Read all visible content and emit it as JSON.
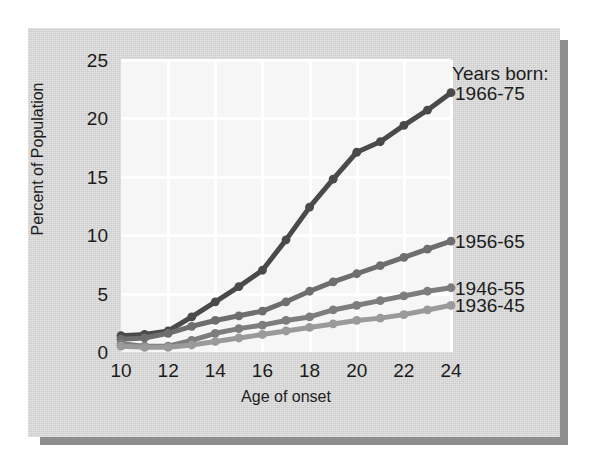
{
  "chart_data": {
    "type": "line",
    "title": "",
    "xlabel": "Age of onset",
    "ylabel": "Percent of Population",
    "legend_title": "Years born:",
    "legend_position": "right-inline",
    "grid": true,
    "xlim": [
      10,
      24
    ],
    "ylim": [
      0,
      25
    ],
    "xticks": [
      10,
      12,
      14,
      16,
      18,
      20,
      22,
      24
    ],
    "yticks": [
      0,
      5,
      10,
      15,
      20,
      25
    ],
    "x": [
      10,
      11,
      12,
      13,
      14,
      15,
      16,
      17,
      18,
      19,
      20,
      21,
      22,
      23,
      24
    ],
    "series": [
      {
        "name": "1966-75",
        "color": "#4a4a4a",
        "values": [
          1.4,
          1.5,
          1.8,
          3.0,
          4.3,
          5.6,
          7.0,
          9.6,
          12.4,
          14.8,
          17.1,
          18.0,
          19.4,
          20.7,
          22.2
        ]
      },
      {
        "name": "1956-65",
        "color": "#6e6e6e",
        "values": [
          1.1,
          1.2,
          1.6,
          2.2,
          2.7,
          3.1,
          3.5,
          4.3,
          5.2,
          6.0,
          6.7,
          7.4,
          8.1,
          8.8,
          9.5
        ]
      },
      {
        "name": "1946-55",
        "color": "#7d7d7d",
        "values": [
          0.7,
          0.5,
          0.5,
          1.0,
          1.6,
          2.0,
          2.3,
          2.7,
          3.0,
          3.6,
          4.0,
          4.4,
          4.8,
          5.2,
          5.5
        ]
      },
      {
        "name": "1936-45",
        "color": "#9a9a9a",
        "values": [
          0.5,
          0.4,
          0.4,
          0.6,
          0.9,
          1.2,
          1.5,
          1.8,
          2.1,
          2.4,
          2.7,
          2.9,
          3.2,
          3.6,
          4.0
        ]
      }
    ]
  },
  "axes": {
    "y_title": "Percent of Population",
    "x_title": "Age of onset"
  },
  "legend": {
    "heading": "Years born:",
    "entries": [
      {
        "label": "1966-75",
        "color": "#4a4a4a"
      },
      {
        "label": "1956-65",
        "color": "#6e6e6e"
      },
      {
        "label": "1946-55",
        "color": "#7d7d7d"
      },
      {
        "label": "1936-45",
        "color": "#9a9a9a"
      }
    ]
  },
  "colors": {
    "page_background": "#ffffff",
    "card_background": "#cccccc",
    "card_shadow": "#8d8d8d",
    "panel_background": "#f6f6f6",
    "gridline": "#ffffff",
    "text": "#1c1c1c"
  }
}
